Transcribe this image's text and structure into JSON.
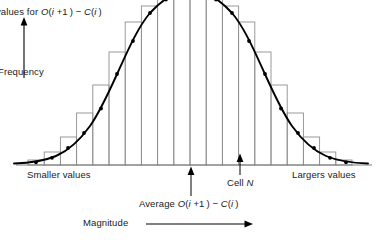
{
  "figure": {
    "title_note": "values for O(i +1) - C(i)",
    "y_axis_label": "Frequency",
    "x_axis_label": "Magnitude",
    "left_tail_label": "Smaller values",
    "right_tail_label": "Largers values",
    "center_marker_label": "Average O(i +1) - C(i)",
    "cell_marker_label": "Cell N",
    "colors": {
      "curve": "#000000",
      "bars": "#8c8c8c",
      "axis": "#000000",
      "text": "#1a1a1a"
    }
  },
  "chart_data": {
    "type": "bar",
    "subtitle": "",
    "xlabel": "Magnitude",
    "ylabel": "Frequency",
    "grid": false,
    "legend": false,
    "xlim": [
      0,
      20
    ],
    "ylim": [
      0,
      100
    ],
    "categories": [
      "1",
      "2",
      "3",
      "4",
      "5",
      "6",
      "7",
      "8",
      "9",
      "10",
      "11",
      "12",
      "13",
      "14",
      "15",
      "16",
      "17",
      "18",
      "19",
      "20"
    ],
    "values": [
      3,
      8,
      19,
      36,
      60,
      82,
      96,
      100,
      100,
      100,
      100,
      100,
      96,
      82,
      60,
      36,
      19,
      8,
      3,
      2
    ],
    "series": [
      {
        "name": "Histogram of O(i+1) - C(i) frequencies",
        "values": [
          3,
          8,
          19,
          36,
          60,
          82,
          96,
          100,
          100,
          100,
          100,
          100,
          96,
          82,
          60,
          36,
          19,
          8,
          3,
          2
        ]
      },
      {
        "name": "Fitted normal distribution curve",
        "type": "line",
        "x": [
          0.0,
          1.0,
          2.0,
          3.0,
          4.0,
          5.0,
          6.0,
          7.0,
          8.0,
          9.0,
          10.0,
          11.0,
          12.0,
          13.0,
          14.0,
          15.0,
          16.0,
          17.0,
          18.0,
          19.0,
          20.0
        ],
        "values": [
          1,
          3,
          7,
          14,
          27,
          45,
          66,
          85,
          96,
          100,
          101,
          100,
          96,
          85,
          66,
          45,
          27,
          14,
          7,
          3,
          1
        ]
      }
    ],
    "annotations": [
      {
        "name": "average-marker",
        "label": "Average O(i +1) - C(i)",
        "x": 10.0,
        "kind": "up-arrow-below-axis"
      },
      {
        "name": "cell-n-marker",
        "label": "Cell N",
        "x": 13.0,
        "kind": "up-arrow-below-axis"
      },
      {
        "name": "smaller-values",
        "label": "Smaller values",
        "x": 2.0,
        "kind": "tail-text"
      },
      {
        "name": "largers-values",
        "label": "Largers values",
        "x": 18.0,
        "kind": "tail-text"
      },
      {
        "name": "magnitude-axis-arrow",
        "label": "Magnitude",
        "kind": "horizontal-arrow"
      },
      {
        "name": "frequency-axis-arrow",
        "label": "Frequency",
        "kind": "vertical-arrow"
      }
    ],
    "markers_on_curve": true
  }
}
